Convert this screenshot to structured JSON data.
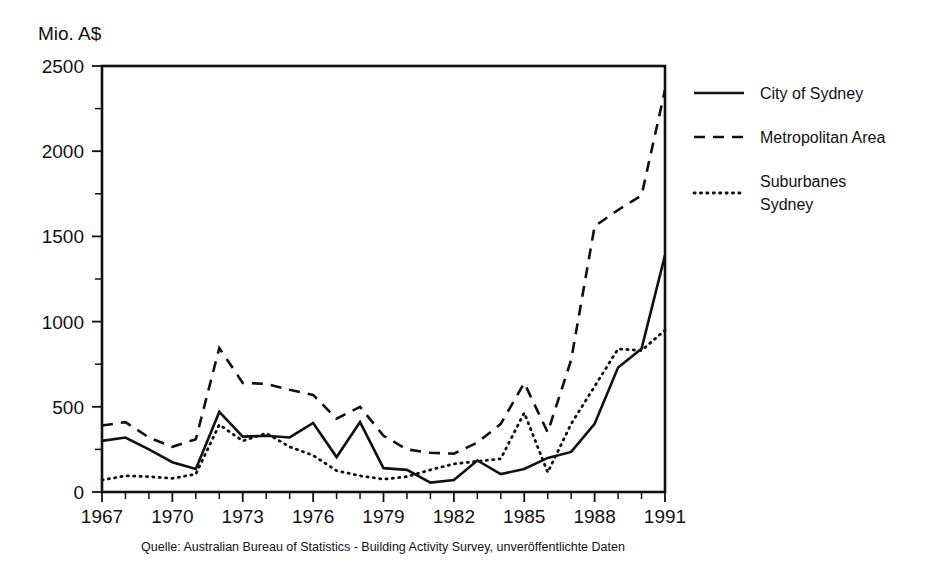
{
  "chart_data": {
    "type": "line",
    "title": "",
    "ylabel": "Mio. A$",
    "xlabel": "",
    "ylim": [
      0,
      2500
    ],
    "xlim": [
      1967,
      1991
    ],
    "y_ticks": [
      0,
      500,
      1000,
      1500,
      2000,
      2500
    ],
    "y_minor_step": 250,
    "x_ticks": [
      1967,
      1970,
      1973,
      1976,
      1979,
      1982,
      1985,
      1988,
      1991
    ],
    "x_minor_step": 1,
    "grid": false,
    "legend_position": "right",
    "x": [
      1967,
      1968,
      1969,
      1970,
      1971,
      1972,
      1973,
      1974,
      1975,
      1976,
      1977,
      1978,
      1979,
      1980,
      1981,
      1982,
      1983,
      1984,
      1985,
      1986,
      1987,
      1988,
      1989,
      1990,
      1991
    ],
    "series": [
      {
        "name": "City of Sydney",
        "style": "solid",
        "color": "#111111",
        "values": [
          300,
          320,
          250,
          175,
          135,
          470,
          325,
          330,
          320,
          405,
          205,
          410,
          140,
          130,
          55,
          70,
          185,
          105,
          135,
          200,
          235,
          400,
          730,
          840,
          1390
        ]
      },
      {
        "name": "Metropolitan Area",
        "style": "dashed",
        "color": "#111111",
        "values": [
          390,
          410,
          320,
          265,
          310,
          845,
          640,
          635,
          600,
          570,
          430,
          500,
          330,
          250,
          230,
          225,
          290,
          400,
          640,
          350,
          775,
          1560,
          1655,
          1740,
          2360
        ]
      },
      {
        "name": "Suburbanes Sydney",
        "style": "dotted",
        "color": "#111111",
        "values": [
          70,
          95,
          90,
          80,
          105,
          395,
          300,
          345,
          265,
          215,
          125,
          95,
          75,
          90,
          130,
          165,
          180,
          195,
          465,
          115,
          400,
          620,
          840,
          830,
          950
        ]
      }
    ]
  },
  "legend": {
    "items": [
      {
        "label": "City of Sydney",
        "style": "solid"
      },
      {
        "label": "Metropolitan Area",
        "style": "dashed"
      },
      {
        "label_line1": "Suburbanes",
        "label_line2": "Sydney",
        "style": "dotted"
      }
    ]
  },
  "axis": {
    "y_title": "Mio. A$",
    "y_tick_labels": [
      "2500",
      "2000",
      "1500",
      "1000",
      "500",
      "0"
    ],
    "x_tick_labels": [
      "1967",
      "1970",
      "1973",
      "1976",
      "1979",
      "1982",
      "1985",
      "1988",
      "1991"
    ]
  },
  "footer": {
    "source": "Quelle: Australian Bureau of Statistics - Building Activity Survey, unveröffentlichte Daten"
  }
}
